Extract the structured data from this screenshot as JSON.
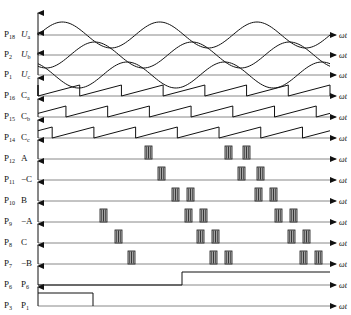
{
  "figure": {
    "type": "timing-waveform-diagram",
    "axis_label": "ωt",
    "plot": {
      "x_start": 38,
      "x_end": 330,
      "arrow_tip": 336
    },
    "rows": [
      {
        "id": "Ua",
        "pin": "P",
        "pin_sub": "18",
        "signal": "U",
        "signal_sub": "a",
        "kind": "sine",
        "baseline": 35,
        "amp": 13,
        "periods": 3,
        "phase_deg": 0
      },
      {
        "id": "Ub",
        "pin": "P",
        "pin_sub": "2",
        "signal": "U",
        "signal_sub": "b",
        "kind": "sine",
        "baseline": 55,
        "amp": 13,
        "periods": 3,
        "phase_deg": -120
      },
      {
        "id": "Uc",
        "pin": "P",
        "pin_sub": "1",
        "signal": "U",
        "signal_sub": "c",
        "kind": "sine",
        "baseline": 75,
        "amp": 13,
        "periods": 3,
        "phase_deg": -240
      },
      {
        "id": "Ca",
        "pin": "P",
        "pin_sub": "16",
        "signal": "C",
        "signal_sub": "a",
        "kind": "sawtooth",
        "baseline": 96,
        "amp": 11,
        "cycles": 7,
        "phase_frac": 0.0
      },
      {
        "id": "Cb",
        "pin": "P",
        "pin_sub": "15",
        "signal": "C",
        "signal_sub": "b",
        "kind": "sawtooth",
        "baseline": 117,
        "amp": 11,
        "cycles": 7,
        "phase_frac": 0.33
      },
      {
        "id": "Cc",
        "pin": "P",
        "pin_sub": "14",
        "signal": "C",
        "signal_sub": "c",
        "kind": "sawtooth",
        "baseline": 138,
        "amp": 11,
        "cycles": 7,
        "phase_frac": 0.66
      },
      {
        "id": "A",
        "pin": "P",
        "pin_sub": "12",
        "signal": "A",
        "signal_sub": "",
        "kind": "pulses",
        "baseline": 159,
        "height": 13,
        "bursts": [
          145,
          225,
          243
        ]
      },
      {
        "id": "negC",
        "pin": "P",
        "pin_sub": "11",
        "signal": "−C",
        "signal_sub": "",
        "kind": "pulses",
        "baseline": 180,
        "height": 13,
        "bursts": [
          158,
          238,
          257
        ]
      },
      {
        "id": "B",
        "pin": "P",
        "pin_sub": "10",
        "signal": "B",
        "signal_sub": "",
        "kind": "pulses",
        "baseline": 201,
        "height": 13,
        "bursts": [
          172,
          187,
          255,
          270
        ]
      },
      {
        "id": "negA",
        "pin": "P",
        "pin_sub": "9",
        "signal": "−A",
        "signal_sub": "",
        "kind": "pulses",
        "baseline": 222,
        "height": 13,
        "bursts": [
          100,
          185,
          200,
          275,
          290
        ]
      },
      {
        "id": "C",
        "pin": "P",
        "pin_sub": "8",
        "signal": "C",
        "signal_sub": "",
        "kind": "pulses",
        "baseline": 243,
        "height": 13,
        "bursts": [
          115,
          197,
          212,
          288,
          303
        ]
      },
      {
        "id": "negB",
        "pin": "P",
        "pin_sub": "7",
        "signal": "−B",
        "signal_sub": "",
        "kind": "pulses",
        "baseline": 264,
        "height": 13,
        "bursts": [
          128,
          210,
          225,
          300,
          315
        ]
      },
      {
        "id": "P6",
        "pin": "P",
        "pin_sub": "6",
        "signal": "P",
        "signal_sub": "6",
        "kind": "step-up",
        "baseline": 285,
        "height": 13,
        "edge": 182
      },
      {
        "id": "P1",
        "pin": "P",
        "pin_sub": "3",
        "signal": "P",
        "signal_sub": "1",
        "kind": "step-down",
        "baseline": 306,
        "height": 13,
        "edge": 93
      }
    ]
  }
}
